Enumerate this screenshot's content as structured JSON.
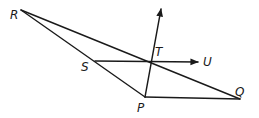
{
  "diagram": {
    "type": "geometry",
    "points": {
      "R": {
        "label": "R",
        "x": 21,
        "y": 10
      },
      "S": {
        "label": "S",
        "x": 95,
        "y": 61
      },
      "T": {
        "label": "T",
        "x": 151,
        "y": 62
      },
      "U": {
        "label": "U",
        "x": 198,
        "y": 62
      },
      "P": {
        "label": "P",
        "x": 145,
        "y": 97
      },
      "Q": {
        "label": "Q",
        "x": 240,
        "y": 99
      }
    },
    "segments": [
      {
        "from": "R",
        "to": "Q"
      },
      {
        "from": "R",
        "to": "P"
      },
      {
        "from": "P",
        "to": "Q"
      }
    ],
    "rays": [
      {
        "from": "S",
        "through": "T",
        "label": "ray SU"
      },
      {
        "from": "P",
        "through": "T",
        "label": "ray PT"
      }
    ],
    "stroke_color": "#1a1a1a"
  }
}
